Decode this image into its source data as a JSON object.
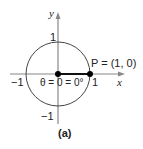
{
  "diagram": {
    "axes": {
      "x_label": "x",
      "y_label": "y"
    },
    "ticks": {
      "x_neg": "−1",
      "x_pos": "1",
      "y_pos": "1",
      "y_neg": "−1"
    },
    "point_label": "P = (1, 0)",
    "angle_label": "θ = 0 = 0°",
    "caption": "(a)",
    "colors": {
      "circle": "#444444",
      "axis": "#888888",
      "ray": "#111111",
      "point": "#000000"
    }
  }
}
